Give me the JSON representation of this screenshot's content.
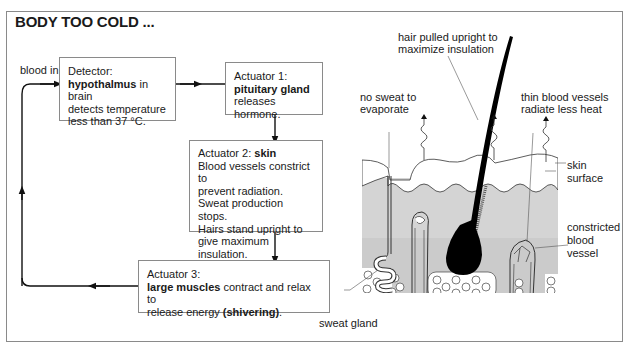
{
  "title": "BODY TOO COLD ...",
  "flow": {
    "blood_in": "blood in",
    "detector": {
      "heading": "Detector:",
      "bold": "hypothalmus",
      "rest1": " in brain",
      "line2": "detects temperature",
      "line3": "less than 37 °C."
    },
    "actuator1": {
      "heading": "Actuator 1:",
      "bold": "pituitary gland",
      "line2": "releases hormone."
    },
    "actuator2": {
      "heading": "Actuator 2: ",
      "bold": "skin",
      "lines": [
        "Blood vessels constrict to",
        "prevent radiation.",
        "Sweat production stops.",
        "Hairs stand upright to",
        "give maximum insulation."
      ]
    },
    "actuator3": {
      "heading": "Actuator 3:",
      "bold": "large muscles",
      "rest1": " contract and relax to",
      "line2a": "release energy ",
      "line2b": "(shivering)",
      "line2c": "."
    }
  },
  "skin_diagram": {
    "labels": {
      "hair": [
        "hair pulled upright to",
        "maximize insulation"
      ],
      "no_sweat": [
        "no sweat to",
        "evaporate"
      ],
      "thin_vessels": [
        "thin blood vessels",
        "radiate less heat"
      ],
      "skin_surface": [
        "skin",
        "surface"
      ],
      "constricted": [
        "constricted",
        "blood",
        "vessel"
      ],
      "sweat_gland": "sweat gland"
    },
    "colors": {
      "dermis": "#d4d4d4",
      "epidermis": "#ffffff",
      "hair": "#000000",
      "outline": "#333333"
    }
  }
}
